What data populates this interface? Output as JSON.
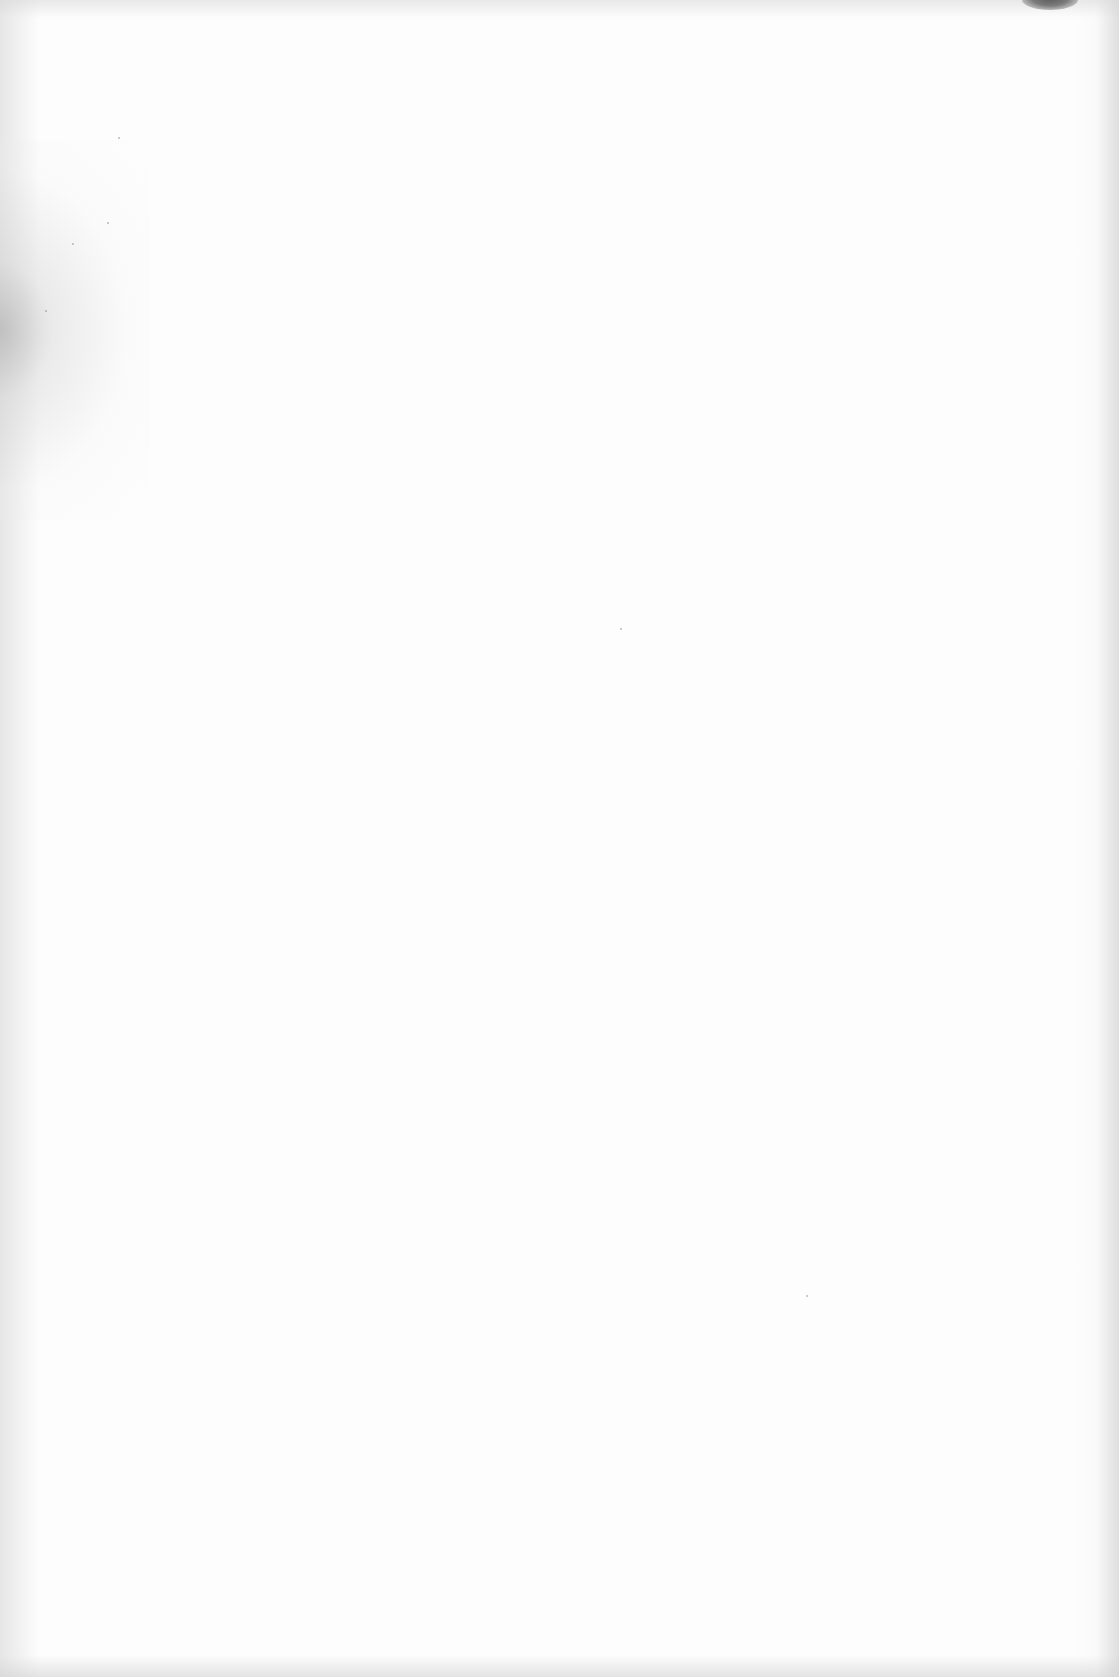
{
  "document": {
    "type": "scanned-page",
    "content": "",
    "is_blank": true
  },
  "artifacts": [
    {
      "kind": "edge-shading",
      "position": "left",
      "color": "#c8c8c8"
    },
    {
      "kind": "speckle-band",
      "position": "left-upper",
      "color": "#a0a0a0"
    },
    {
      "kind": "edge-shading",
      "position": "right",
      "color": "#cdcdcd"
    },
    {
      "kind": "smudge",
      "position": "top-right",
      "color": "#5a5a5a"
    }
  ],
  "colors": {
    "paper": "#fdfdfd",
    "smudge": "#5a5a5a"
  }
}
